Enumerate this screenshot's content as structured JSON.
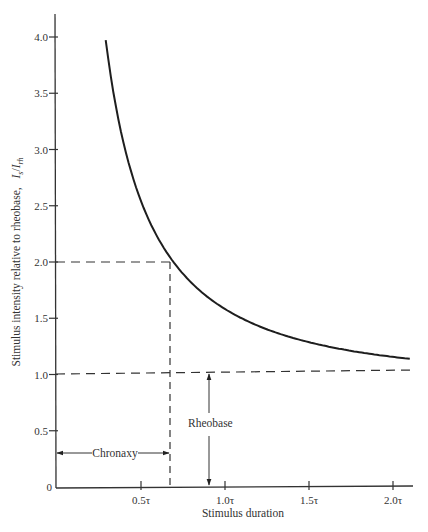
{
  "chart_data": {
    "type": "line",
    "title": "",
    "xlabel": "Stimulus duration",
    "ylabel": "Stimulus intensity relative to rheobase,  I_s/I_rh",
    "ylabel_main": "Stimulus intensity relative to rheobase,",
    "ylabel_symbol_I": "I",
    "ylabel_symbol_sub_s": "s",
    "ylabel_symbol_slash": "/",
    "ylabel_symbol_I2": "I",
    "ylabel_symbol_sub_rh": "rh",
    "xlim": [
      0,
      2.1
    ],
    "ylim": [
      0,
      4.2
    ],
    "x_unit": "τ",
    "x_ticks": [
      {
        "value": 0.5,
        "label": "0.5τ"
      },
      {
        "value": 1.0,
        "label": "1.0τ"
      },
      {
        "value": 1.5,
        "label": "1.5τ"
      },
      {
        "value": 2.0,
        "label": "2.0τ"
      }
    ],
    "y_ticks": [
      {
        "value": 0,
        "label": "0"
      },
      {
        "value": 0.5,
        "label": "0.5"
      },
      {
        "value": 1.0,
        "label": "1.0"
      },
      {
        "value": 1.5,
        "label": "1.5"
      },
      {
        "value": 2.0,
        "label": "2.0"
      },
      {
        "value": 2.5,
        "label": "2.5"
      },
      {
        "value": 3.0,
        "label": "3.0"
      },
      {
        "value": 3.5,
        "label": "3.5"
      },
      {
        "value": 4.0,
        "label": "4.0"
      }
    ],
    "grid": false,
    "legend": null,
    "series": [
      {
        "name": "Strength-duration curve",
        "formula": "I_s/I_rh = 1 / (1 - exp(-t/τ))",
        "x": [
          0.29,
          0.35,
          0.4,
          0.5,
          0.6,
          0.693,
          0.8,
          0.9,
          1.0,
          1.2,
          1.4,
          1.6,
          1.8,
          2.0,
          2.1
        ],
        "y": [
          3.92,
          3.38,
          3.03,
          2.54,
          2.22,
          2.0,
          1.82,
          1.69,
          1.58,
          1.43,
          1.33,
          1.25,
          1.2,
          1.16,
          1.14
        ]
      }
    ],
    "reference_lines": [
      {
        "name": "rheobase-level",
        "type": "horizontal",
        "y": 1.0,
        "style": "dashed",
        "x_range": [
          0,
          2.1
        ]
      },
      {
        "name": "twice-rheobase-level",
        "type": "horizontal",
        "y": 2.0,
        "style": "dashed",
        "x_range": [
          0,
          0.693
        ]
      },
      {
        "name": "chronaxy-time",
        "type": "vertical",
        "x": 0.693,
        "style": "dashed",
        "y_range": [
          0,
          2.0
        ]
      }
    ],
    "annotations": [
      {
        "text": "Chronaxy",
        "type": "double-arrow-horizontal",
        "from_x": 0,
        "to_x": 0.693,
        "y": 0.3
      },
      {
        "text": "Rheobase",
        "type": "double-arrow-vertical",
        "x": 0.9,
        "from_y": 0,
        "to_y": 1.0
      }
    ]
  }
}
